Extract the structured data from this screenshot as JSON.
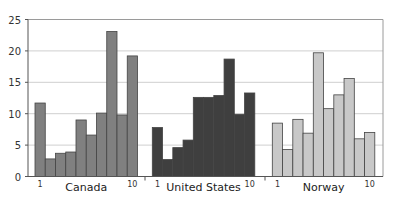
{
  "chart_data": {
    "type": "bar",
    "title": "",
    "xlabel": "",
    "ylabel": "",
    "ylim": [
      0,
      25
    ],
    "yticks": [
      0,
      5,
      10,
      15,
      20,
      25
    ],
    "grid": true,
    "legend": null,
    "groups": [
      {
        "name": "Canada",
        "color": "#808080",
        "categories": [
          "1",
          "2",
          "3",
          "4",
          "5",
          "6",
          "7",
          "8",
          "9",
          "10"
        ],
        "values": [
          11.7,
          2.8,
          3.7,
          3.9,
          9.0,
          6.6,
          10.1,
          23.1,
          9.8,
          19.2
        ]
      },
      {
        "name": "United States",
        "color": "#3f3f3f",
        "categories": [
          "1",
          "2",
          "3",
          "4",
          "5",
          "6",
          "7",
          "8",
          "9",
          "10"
        ],
        "values": [
          7.8,
          2.7,
          4.6,
          5.8,
          12.6,
          12.6,
          12.9,
          18.7,
          9.9,
          13.3
        ]
      },
      {
        "name": "Norway",
        "color": "#c8c8c8",
        "categories": [
          "1",
          "2",
          "3",
          "4",
          "5",
          "6",
          "7",
          "8",
          "9",
          "10"
        ],
        "values": [
          8.5,
          4.3,
          9.1,
          6.9,
          19.7,
          10.8,
          13.0,
          15.6,
          6.0,
          7.0
        ]
      }
    ],
    "tick_labels_shown": [
      "1",
      "10"
    ]
  },
  "labels": {
    "group_names": [
      "Canada",
      "United States",
      "Norway"
    ],
    "first_tick": "1",
    "last_tick": "10"
  },
  "colors": {
    "grid": "#cfcfcf",
    "axis": "#555555",
    "bar_border": "#444444"
  }
}
